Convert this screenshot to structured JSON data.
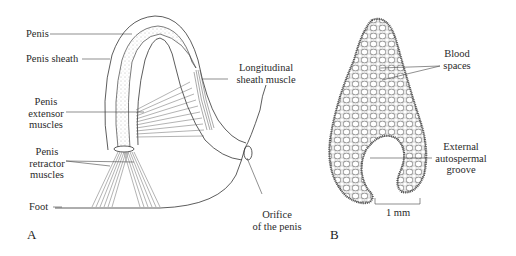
{
  "figure": {
    "panel_a": {
      "letter": "A",
      "labels": {
        "penis": "Penis",
        "penis_sheath": "Penis sheath",
        "extensor_1": "Penis",
        "extensor_2": "extensor",
        "extensor_3": "muscles",
        "retractor_1": "Penis",
        "retractor_2": "retractor",
        "retractor_3": "muscles",
        "foot": "Foot",
        "longitudinal_1": "Longitudinal",
        "longitudinal_2": "sheath muscle",
        "orifice_1": "Orifice",
        "orifice_2": "of the penis"
      }
    },
    "panel_b": {
      "letter": "B",
      "labels": {
        "blood_1": "Blood",
        "blood_2": "spaces",
        "groove_1": "External",
        "groove_2": "autospermal",
        "groove_3": "groove",
        "scale": "1 mm"
      }
    }
  }
}
